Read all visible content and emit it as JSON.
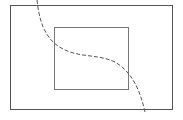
{
  "diagram": {
    "background": "#ffffff",
    "outer_rect": {
      "x": 10.5,
      "y": 5.5,
      "width": 162,
      "height": 104,
      "stroke": "#555555",
      "stroke_width": 1
    },
    "inner_rect": {
      "x": 54.5,
      "y": 27.5,
      "width": 74,
      "height": 62,
      "stroke": "#777777",
      "stroke_width": 1
    },
    "curve": {
      "style": "dashed",
      "dash": "4 2",
      "stroke": "#555555",
      "stroke_width": 1,
      "path": "M 37 0 C 40 30, 50 45, 70 52 C 85 57, 100 55, 115 62 C 132 72, 140 90, 145 112"
    }
  }
}
